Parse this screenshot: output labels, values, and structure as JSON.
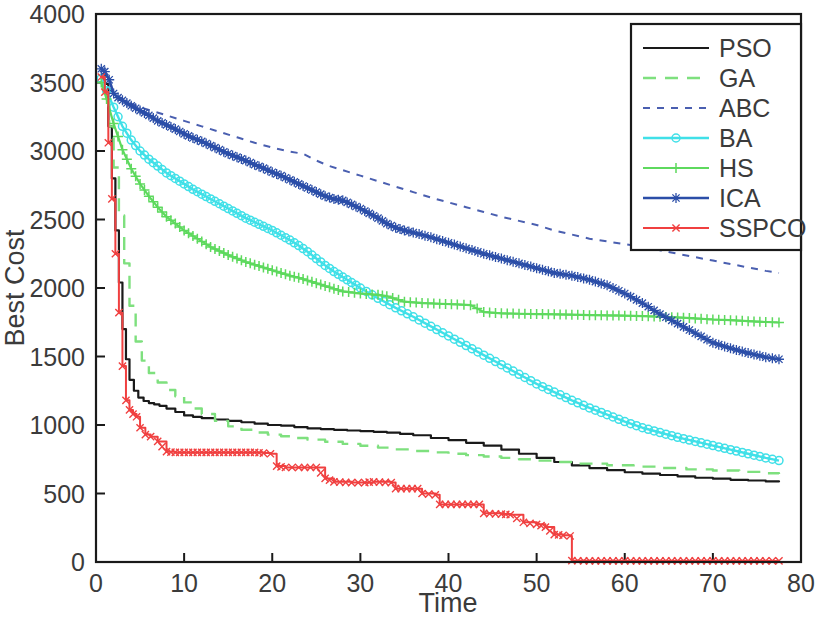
{
  "chart_data": {
    "type": "line",
    "title": "",
    "xlabel": "Time",
    "ylabel": "Best Cost",
    "xlim": [
      0,
      80
    ],
    "ylim": [
      0,
      4000
    ],
    "xticks": [
      0,
      10,
      20,
      30,
      40,
      50,
      60,
      70,
      80
    ],
    "yticks": [
      0,
      500,
      1000,
      1500,
      2000,
      2500,
      3000,
      3500,
      4000
    ],
    "xtick_labels": [
      "0",
      "10",
      "20",
      "30",
      "40",
      "50",
      "60",
      "70",
      "80"
    ],
    "ytick_labels": [
      "0",
      "500",
      "1000",
      "1500",
      "2000",
      "2500",
      "3000",
      "3500",
      "4000"
    ],
    "grid": false,
    "legend_position": "upper right",
    "series": [
      {
        "name": "PSO",
        "color": "#1a1a1a",
        "style": "solid",
        "marker": "none",
        "x": [
          0.6,
          1.0,
          1.4,
          1.8,
          2.2,
          2.6,
          3.0,
          3.4,
          3.8,
          4.3,
          4.8,
          5.4,
          6.0,
          6.6,
          7.2,
          8.0,
          9.0,
          10.0,
          11.0,
          12.0,
          13.5,
          15.0,
          16.5,
          18.0,
          19.5,
          21.0,
          22.5,
          24.0,
          25.5,
          27.0,
          28.5,
          30.0,
          31.5,
          33.0,
          34.5,
          36.0,
          38.0,
          40.0,
          42.0,
          44.0,
          46.0,
          48.0,
          50.0,
          52.0,
          54.0,
          56.0,
          58.0,
          60.0,
          62.0,
          64.0,
          66.0,
          68.0,
          70.0,
          72.0,
          74.0,
          76.0,
          77.5
        ],
        "y": [
          3560,
          3490,
          3180,
          2800,
          2420,
          2040,
          1700,
          1480,
          1330,
          1250,
          1200,
          1175,
          1160,
          1150,
          1140,
          1120,
          1095,
          1070,
          1060,
          1050,
          1040,
          1030,
          1020,
          1010,
          1000,
          995,
          985,
          975,
          970,
          965,
          960,
          955,
          950,
          945,
          935,
          925,
          905,
          890,
          870,
          850,
          820,
          790,
          760,
          730,
          705,
          685,
          670,
          655,
          645,
          635,
          625,
          615,
          608,
          600,
          595,
          588,
          583
        ]
      },
      {
        "name": "GA",
        "color": "#7ee07e",
        "style": "dashed",
        "marker": "none",
        "x": [
          0.6,
          1.0,
          1.5,
          2.0,
          2.6,
          3.2,
          3.8,
          4.5,
          5.2,
          6.0,
          7.0,
          8.0,
          9.0,
          10.0,
          11.0,
          12.0,
          13.5,
          15.0,
          16.5,
          18.0,
          19.5,
          21.0,
          22.5,
          24.0,
          26.0,
          28.0,
          30.0,
          32.0,
          34.0,
          36.0,
          38.0,
          40.0,
          42.0,
          44.0,
          46.0,
          48.0,
          50.0,
          52.0,
          55.0,
          58.0,
          61.0,
          64.0,
          67.0,
          70.0,
          73.0,
          76.0,
          77.5
        ],
        "y": [
          3490,
          3430,
          3180,
          2880,
          2530,
          2180,
          1870,
          1610,
          1470,
          1380,
          1310,
          1255,
          1210,
          1165,
          1120,
          1080,
          1030,
          990,
          965,
          945,
          930,
          918,
          905,
          893,
          878,
          862,
          848,
          835,
          822,
          810,
          800,
          790,
          780,
          770,
          760,
          750,
          740,
          730,
          718,
          706,
          696,
          686,
          676,
          668,
          658,
          648,
          642
        ]
      },
      {
        "name": "ABC",
        "color": "#4a5fb0",
        "style": "dotted",
        "marker": "none",
        "x": [
          0.6,
          1.2,
          2.0,
          3.0,
          4.0,
          5.0,
          6.5,
          8.0,
          10.0,
          12.0,
          14.0,
          16.0,
          18.0,
          20.0,
          22.0,
          23.5,
          25.0,
          26.5,
          28.0,
          30.0,
          32.0,
          34.0,
          36.0,
          38.0,
          40.0,
          42.0,
          44.0,
          46.0,
          48.0,
          50.0,
          52.0,
          54.0,
          56.0,
          58.0,
          60.0,
          62.0,
          64.0,
          66.0,
          68.0,
          70.0,
          72.0,
          74.0,
          76.0,
          77.5
        ],
        "y": [
          3560,
          3480,
          3420,
          3380,
          3345,
          3320,
          3290,
          3260,
          3220,
          3180,
          3140,
          3100,
          3060,
          3025,
          2995,
          2980,
          2930,
          2890,
          2860,
          2820,
          2780,
          2740,
          2700,
          2660,
          2625,
          2590,
          2555,
          2520,
          2490,
          2460,
          2420,
          2390,
          2360,
          2340,
          2320,
          2300,
          2275,
          2250,
          2225,
          2200,
          2175,
          2150,
          2125,
          2110
        ]
      },
      {
        "name": "BA",
        "color": "#40e0e8",
        "style": "solid",
        "marker": "circle",
        "x": [
          0.6,
          1.2,
          2.0,
          3.0,
          4.0,
          5.0,
          6.0,
          7.0,
          8.0,
          9.0,
          10.0,
          11.0,
          12.0,
          13.0,
          14.0,
          15.0,
          16.0,
          17.0,
          18.0,
          19.0,
          20.0,
          21.0,
          22.0,
          23.0,
          24.0,
          25.0,
          26.0,
          27.0,
          28.0,
          29.0,
          30.0,
          32.0,
          34.0,
          36.0,
          38.0,
          40.0,
          42.0,
          44.0,
          46.0,
          48.0,
          50.0,
          52.0,
          54.0,
          56.0,
          58.0,
          60.0,
          62.0,
          64.0,
          66.0,
          68.0,
          70.0,
          72.0,
          74.0,
          76.0,
          77.5
        ],
        "y": [
          3530,
          3440,
          3320,
          3180,
          3080,
          3000,
          2940,
          2890,
          2840,
          2800,
          2760,
          2720,
          2685,
          2650,
          2615,
          2580,
          2545,
          2510,
          2480,
          2450,
          2420,
          2385,
          2350,
          2310,
          2265,
          2215,
          2165,
          2120,
          2080,
          2040,
          2000,
          1925,
          1855,
          1790,
          1720,
          1650,
          1580,
          1510,
          1440,
          1370,
          1300,
          1240,
          1180,
          1125,
          1075,
          1025,
          980,
          945,
          910,
          880,
          850,
          820,
          790,
          760,
          740
        ]
      },
      {
        "name": "HS",
        "color": "#5ed95e",
        "style": "solid",
        "marker": "plus",
        "x": [
          0.6,
          1.2,
          2.0,
          3.0,
          4.0,
          5.0,
          6.0,
          7.0,
          8.0,
          9.0,
          10.0,
          11.0,
          12.0,
          13.0,
          14.0,
          15.0,
          16.0,
          17.0,
          18.0,
          19.0,
          20.0,
          21.0,
          22.0,
          23.0,
          24.0,
          25.0,
          26.0,
          27.0,
          28.0,
          30.0,
          32.0,
          33.0,
          35.0,
          37.0,
          39.0,
          41.0,
          42.5,
          44.0,
          46.0,
          48.0,
          50.0,
          52.0,
          54.0,
          56.0,
          58.0,
          60.0,
          62.0,
          64.0,
          66.0,
          68.0,
          70.0,
          72.0,
          74.0,
          76.0,
          77.5
        ],
        "y": [
          3500,
          3380,
          3200,
          3010,
          2870,
          2760,
          2670,
          2590,
          2520,
          2470,
          2420,
          2380,
          2340,
          2300,
          2270,
          2240,
          2215,
          2190,
          2170,
          2150,
          2130,
          2110,
          2090,
          2075,
          2055,
          2035,
          2015,
          1995,
          1975,
          1960,
          1950,
          1940,
          1900,
          1890,
          1885,
          1880,
          1875,
          1825,
          1815,
          1812,
          1810,
          1808,
          1805,
          1802,
          1800,
          1798,
          1795,
          1790,
          1785,
          1778,
          1770,
          1765,
          1758,
          1752,
          1748
        ]
      },
      {
        "name": "ICA",
        "color": "#2b4ea8",
        "style": "solid",
        "marker": "asterisk",
        "x": [
          0.6,
          1.0,
          1.5,
          2.0,
          2.5,
          3.0,
          4.0,
          5.0,
          6.0,
          7.0,
          8.0,
          9.0,
          10.0,
          11.0,
          12.0,
          13.0,
          14.0,
          15.0,
          16.0,
          17.0,
          18.0,
          19.0,
          20.0,
          21.0,
          22.0,
          23.0,
          24.0,
          25.0,
          26.0,
          27.0,
          28.0,
          29.0,
          30.0,
          31.0,
          32.0,
          33.0,
          34.0,
          35.0,
          36.0,
          38.0,
          40.0,
          42.0,
          44.0,
          46.0,
          48.0,
          50.0,
          52.0,
          54.0,
          56.0,
          58.0,
          60.0,
          62.0,
          64.0,
          66.0,
          68.0,
          70.0,
          72.0,
          74.0,
          76.0,
          77.5
        ],
        "y": [
          3600,
          3580,
          3520,
          3420,
          3390,
          3370,
          3330,
          3295,
          3260,
          3220,
          3190,
          3160,
          3125,
          3095,
          3070,
          3040,
          3010,
          2980,
          2955,
          2930,
          2900,
          2875,
          2845,
          2820,
          2790,
          2760,
          2730,
          2700,
          2670,
          2650,
          2640,
          2610,
          2580,
          2545,
          2510,
          2470,
          2440,
          2420,
          2405,
          2370,
          2330,
          2290,
          2250,
          2215,
          2180,
          2145,
          2110,
          2090,
          2060,
          2020,
          1960,
          1890,
          1810,
          1740,
          1670,
          1600,
          1560,
          1525,
          1495,
          1480
        ]
      },
      {
        "name": "SSPCO",
        "color": "#f04040",
        "style": "solid",
        "marker": "x",
        "x": [
          0.6,
          1.0,
          1.4,
          1.8,
          2.2,
          2.6,
          3.0,
          3.4,
          3.8,
          4.2,
          4.6,
          5.0,
          5.6,
          6.2,
          7.0,
          8.0,
          9.0,
          10.0,
          11.0,
          12.0,
          13.0,
          14.0,
          15.0,
          16.0,
          17.0,
          18.0,
          19.0,
          19.8,
          20.5,
          21.5,
          23.0,
          25.0,
          26.0,
          27.0,
          29.0,
          30.5,
          31.5,
          33.5,
          34.0,
          36.5,
          37.0,
          38.5,
          39.0,
          43.5,
          44.0,
          46.0,
          47.0,
          48.5,
          50.0,
          51.0,
          52.0,
          53.0,
          53.8,
          54.0,
          56.0,
          60.0,
          64.0,
          68.0,
          72.0,
          76.0,
          77.5
        ],
        "y": [
          3540,
          3430,
          3060,
          2650,
          2250,
          1820,
          1430,
          1180,
          1110,
          1080,
          1060,
          980,
          930,
          915,
          880,
          805,
          800,
          800,
          800,
          800,
          800,
          800,
          800,
          800,
          800,
          800,
          795,
          790,
          700,
          690,
          690,
          690,
          610,
          585,
          580,
          580,
          585,
          580,
          535,
          535,
          500,
          490,
          420,
          420,
          355,
          350,
          345,
          290,
          275,
          255,
          200,
          195,
          190,
          10,
          8,
          8,
          8,
          8,
          8,
          8,
          8
        ]
      }
    ]
  },
  "legend": {
    "entries": [
      {
        "label": "PSO"
      },
      {
        "label": "GA"
      },
      {
        "label": "ABC"
      },
      {
        "label": "BA"
      },
      {
        "label": "HS"
      },
      {
        "label": "ICA"
      },
      {
        "label": "SSPCO"
      }
    ]
  }
}
